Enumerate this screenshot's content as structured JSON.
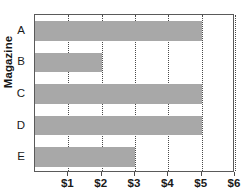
{
  "chart_data": {
    "type": "bar",
    "orientation": "horizontal",
    "title": "",
    "xlabel": "",
    "ylabel": "Magazine",
    "categories": [
      "A",
      "B",
      "C",
      "D",
      "E"
    ],
    "values": [
      5,
      2,
      5,
      5,
      3
    ],
    "series": [
      {
        "name": "",
        "values": [
          5,
          2,
          5,
          5,
          3
        ]
      }
    ],
    "xlim": [
      0,
      6
    ],
    "xticks": [
      1,
      2,
      3,
      4,
      5,
      6
    ],
    "xtick_labels": [
      "$1",
      "$2",
      "$3",
      "$4",
      "$5",
      "$6"
    ],
    "grid": "vertical-dotted",
    "legend": "none",
    "bar_color": "#a8a8a8",
    "axis_color": "#5a5a5a",
    "gridline_color": "#4a4a4a"
  },
  "axes": {
    "y_title": "Magazine",
    "y_categories": [
      "A",
      "B",
      "C",
      "D",
      "E"
    ],
    "x_tick_labels": [
      "$1",
      "$2",
      "$3",
      "$4",
      "$5",
      "$6"
    ]
  },
  "bars": [
    {
      "category": "A",
      "value": 5,
      "label": "$5"
    },
    {
      "category": "B",
      "value": 2,
      "label": "$2"
    },
    {
      "category": "C",
      "value": 5,
      "label": "$5"
    },
    {
      "category": "D",
      "value": 5,
      "label": "$5"
    },
    {
      "category": "E",
      "value": 3,
      "label": "$3"
    }
  ]
}
